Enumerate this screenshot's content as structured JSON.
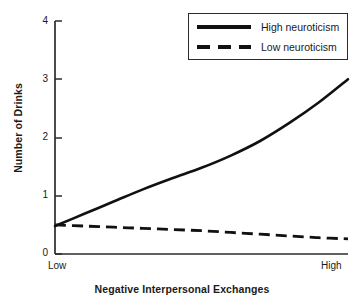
{
  "chart_data": {
    "type": "line",
    "title": "",
    "xlabel": "Negative Interpersonal Exchanges",
    "ylabel": "Number of Drinks",
    "ylim": [
      0,
      4
    ],
    "yticks": [
      "0",
      "1",
      "2",
      "3",
      "4"
    ],
    "ytick_values": [
      0,
      1,
      2,
      3,
      4
    ],
    "xlim": [
      0,
      1
    ],
    "xtick_labels": [
      "Low",
      "High"
    ],
    "grid": false,
    "legend_position": "top-right",
    "x": [
      0,
      0.1,
      0.2,
      0.3,
      0.4,
      0.5,
      0.6,
      0.7,
      0.8,
      0.9,
      1
    ],
    "series": [
      {
        "name": "High neuroticism",
        "style": "solid",
        "color": "#111111",
        "values": [
          0.48,
          0.69,
          0.9,
          1.11,
          1.3,
          1.48,
          1.69,
          1.94,
          2.25,
          2.6,
          3.0
        ]
      },
      {
        "name": "Low neuroticism",
        "style": "dashed",
        "color": "#111111",
        "values": [
          0.5,
          0.48,
          0.46,
          0.44,
          0.42,
          0.4,
          0.37,
          0.34,
          0.31,
          0.28,
          0.26
        ]
      }
    ]
  },
  "axes": {
    "ylabel": "Number of Drinks",
    "xlabel": "Negative Interpersonal Exchanges",
    "ytick_0": "0",
    "ytick_1": "1",
    "ytick_2": "2",
    "ytick_3": "3",
    "ytick_4": "4",
    "xlabel_low": "Low",
    "xlabel_high": "High"
  },
  "legend": {
    "items": [
      {
        "label": "High neuroticism",
        "style": "solid"
      },
      {
        "label": "Low neuroticism",
        "style": "dashed"
      }
    ]
  },
  "colors": {
    "line": "#111111",
    "axis": "#2b2b2b",
    "background": "#ffffff"
  }
}
